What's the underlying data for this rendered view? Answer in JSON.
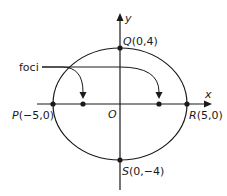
{
  "diagram": {
    "type": "ellipse-foci",
    "axes": {
      "x_label": "x",
      "y_label": "y",
      "origin_label": "O"
    },
    "points": {
      "P": {
        "name": "P",
        "coords": "(−5,0)"
      },
      "Q": {
        "name": "Q",
        "coords": "(0,4)"
      },
      "R": {
        "name": "R",
        "coords": "(5,0)"
      },
      "S": {
        "name": "S",
        "coords": "(0,−4)"
      }
    },
    "foci_label": "foci",
    "colors": {
      "stroke": "#1a1a1a",
      "background": "#ffffff"
    }
  }
}
